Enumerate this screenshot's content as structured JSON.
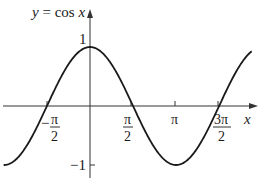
{
  "chart_data": {
    "type": "line",
    "title": "y = cos x",
    "xlabel": "x",
    "ylabel": "y",
    "function": "cos(x)",
    "x_range": [
      -3.15,
      5.9
    ],
    "ylim": [
      -1.2,
      1.3
    ],
    "grid": false,
    "legend": null,
    "x_ticks": [
      {
        "value": -1.5708,
        "label_num": "π",
        "label_den": "2",
        "sign": "−"
      },
      {
        "value": 1.5708,
        "label_num": "π",
        "label_den": "2",
        "sign": ""
      },
      {
        "value": 3.1416,
        "label": "π"
      },
      {
        "value": 4.7124,
        "label_num": "3π",
        "label_den": "2",
        "sign": ""
      }
    ],
    "y_ticks": [
      {
        "value": 1,
        "label": "1"
      },
      {
        "value": -1,
        "label": "−1"
      }
    ],
    "series": [
      {
        "name": "y = cos x",
        "x": [
          -3.1416,
          -1.5708,
          0,
          1.5708,
          3.1416,
          4.7124,
          5.8
        ],
        "values": [
          -1,
          0,
          1,
          0,
          -1,
          0,
          0.89
        ]
      }
    ],
    "labels": {
      "title_y": "y",
      "title_eq": " = cos ",
      "title_x": "x",
      "axis_x": "x",
      "tick_one": "1",
      "tick_neg_one": "−1",
      "tick_neg_pi2_sign": "−",
      "tick_neg_pi2_num": "π",
      "tick_neg_pi2_den": "2",
      "tick_pi2_num": "π",
      "tick_pi2_den": "2",
      "tick_pi": "π",
      "tick_3pi2_num": "3π",
      "tick_3pi2_den": "2"
    },
    "colors": {
      "curve": "#1a1a1a",
      "axes": "#333333"
    }
  }
}
